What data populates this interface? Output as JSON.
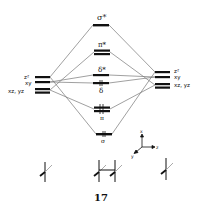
{
  "figure": {
    "number": "17"
  },
  "mo_levels": {
    "sigma_star": "σ*",
    "pi_star": "π*",
    "delta_star": "δ*",
    "delta": "δ",
    "pi": "π",
    "sigma": "σ"
  },
  "left_fragment": {
    "z2": "z²",
    "xy": "xy",
    "xz_yz": "xz, yz"
  },
  "right_fragment": {
    "z2": "z²",
    "xy": "xy",
    "xz_yz": "xz, yz"
  },
  "axes": {
    "x": "x",
    "y": "y",
    "z": "z"
  },
  "colors": {
    "ink": "#111111",
    "line": "#777777",
    "background": "#ffffff"
  }
}
